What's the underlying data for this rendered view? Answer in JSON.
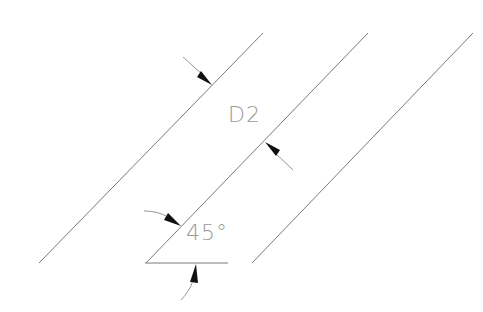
{
  "drawing": {
    "colors": {
      "line": "#7a7a7a",
      "arrowhead": "#111111",
      "text": "#9a9a9a",
      "background": "#ffffff"
    },
    "parallel_lines": [
      {
        "name": "left",
        "x1": 39,
        "y1": 263,
        "x2": 263,
        "y2": 33
      },
      {
        "name": "middle",
        "x1": 146,
        "y1": 263,
        "x2": 368,
        "y2": 33
      },
      {
        "name": "right",
        "x1": 252,
        "y1": 263,
        "x2": 473,
        "y2": 33
      }
    ],
    "base_line": {
      "x1": 145,
      "y1": 263,
      "x2": 228,
      "y2": 263
    },
    "dimension": {
      "label": "D2",
      "description": "perpendicular distance between left and middle parallel lines"
    },
    "angle": {
      "label": "45°",
      "value_degrees": 45
    }
  }
}
